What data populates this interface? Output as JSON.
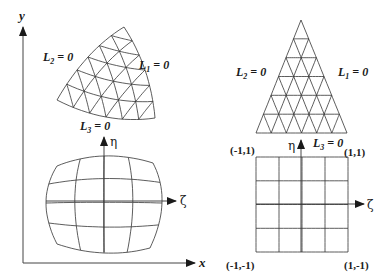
{
  "figure": {
    "left_panel": {
      "axes": {
        "x_label": "x",
        "y_label": "y"
      },
      "curved_triangle": {
        "subdivisions": 6,
        "edge_labels": {
          "L1": "L",
          "L1_sub": "1",
          "L2": "L",
          "L2_sub": "2",
          "L3": "L",
          "L3_sub": "3",
          "eq": " = 0"
        }
      },
      "curved_quad": {
        "grid": "4x4",
        "local_axes": {
          "eta": "η",
          "zeta": "ζ"
        }
      }
    },
    "right_panel": {
      "parent_triangle": {
        "subdivisions": 6,
        "edge_labels": {
          "L1": "L",
          "L1_sub": "1",
          "L2": "L",
          "L2_sub": "2",
          "L3": "L",
          "L3_sub": "3",
          "eq": " = 0"
        }
      },
      "parent_square": {
        "grid": "4x4",
        "local_axes": {
          "eta": "η",
          "zeta": "ζ"
        },
        "corner_labels": {
          "top_left": "(-1,1)",
          "top_right": "(1,1)",
          "bottom_left": "(-1,-1)",
          "bottom_right": "(1,-1)"
        }
      }
    },
    "colors": {
      "line": "#333333",
      "background": "#ffffff"
    }
  }
}
